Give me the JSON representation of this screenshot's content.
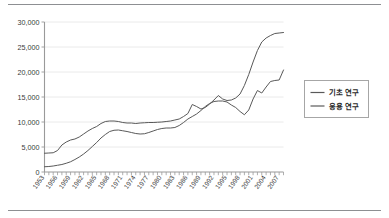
{
  "chart_data": {
    "type": "line",
    "title": "",
    "xlabel": "",
    "ylabel": "",
    "ylim": [
      0,
      30000
    ],
    "xlim": [
      1953,
      2008
    ],
    "grid": true,
    "legend_position": "right",
    "y_ticks": [
      "0",
      "5,000",
      "10,000",
      "15,000",
      "20,000",
      "25,000",
      "30,000"
    ],
    "y_tick_values": [
      0,
      5000,
      10000,
      15000,
      20000,
      25000,
      30000
    ],
    "x_tick_labels": [
      "1953",
      "1956",
      "1959",
      "1962",
      "1965",
      "1968",
      "1971",
      "1974",
      "1977",
      "1980",
      "1983",
      "1986",
      "1989",
      "1992",
      "1995",
      "1998",
      "2001",
      "2004",
      "2007"
    ],
    "x": [
      1953,
      1954,
      1955,
      1956,
      1957,
      1958,
      1959,
      1960,
      1961,
      1962,
      1963,
      1964,
      1965,
      1966,
      1967,
      1968,
      1969,
      1970,
      1971,
      1972,
      1973,
      1974,
      1975,
      1976,
      1977,
      1978,
      1979,
      1980,
      1981,
      1982,
      1983,
      1984,
      1985,
      1986,
      1987,
      1988,
      1989,
      1990,
      1991,
      1992,
      1993,
      1994,
      1995,
      1996,
      1997,
      1998,
      1999,
      2000,
      2001,
      2002,
      2003,
      2004,
      2005,
      2006,
      2007,
      2008
    ],
    "series": [
      {
        "name": "기초 연구",
        "color": "#595959",
        "values": [
          3750,
          3800,
          3850,
          4300,
          5400,
          6000,
          6400,
          6600,
          7000,
          7600,
          8200,
          8700,
          9100,
          9700,
          10100,
          10200,
          10200,
          10100,
          9900,
          9800,
          9800,
          9700,
          9800,
          9850,
          9900,
          9900,
          9950,
          10000,
          10100,
          10200,
          10400,
          10600,
          11100,
          11700,
          13500,
          13100,
          12600,
          12900,
          13600,
          14400,
          15300,
          14600,
          14300,
          14400,
          14800,
          15600,
          17300,
          19500,
          22000,
          24300,
          26000,
          26800,
          27300,
          27700,
          27800,
          27900
        ]
      },
      {
        "name": "응용 연구",
        "color": "#595959",
        "values": [
          1050,
          1100,
          1200,
          1350,
          1500,
          1750,
          2050,
          2500,
          3000,
          3600,
          4300,
          5100,
          5900,
          6800,
          7500,
          8100,
          8350,
          8400,
          8250,
          8100,
          7900,
          7700,
          7600,
          7650,
          7900,
          8200,
          8500,
          8700,
          8800,
          8800,
          8900,
          9300,
          9900,
          10600,
          11100,
          11600,
          12300,
          13100,
          13700,
          14100,
          14200,
          14200,
          14000,
          13400,
          12900,
          12100,
          11450,
          12400,
          14600,
          16300,
          15800,
          17000,
          18100,
          18300,
          18400,
          20400
        ]
      }
    ],
    "legend": [
      {
        "label": "기초 연구"
      },
      {
        "label": "응용 연구"
      }
    ]
  },
  "colors": {
    "line": "#595959",
    "grid": "#e8e8e8",
    "axis": "#9a9a9a",
    "legend_border": "#a6a6a6",
    "rule": "#8d8f92",
    "text": "#3a3a3a"
  }
}
